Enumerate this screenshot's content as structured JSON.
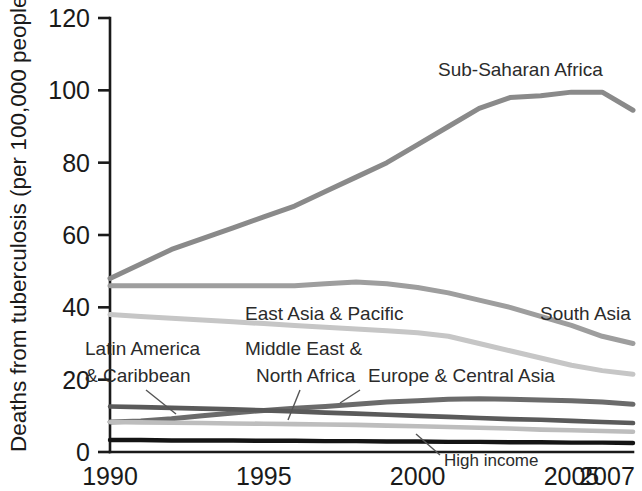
{
  "chart_data": {
    "type": "line",
    "title": "",
    "xlabel": "",
    "ylabel": "Deaths from tuberculosis (per 100,000 people)",
    "xlim": [
      1990,
      2007
    ],
    "ylim": [
      0,
      120
    ],
    "yticks": [
      0,
      20,
      40,
      60,
      80,
      100,
      120
    ],
    "ytick_labels": [
      "0",
      "20",
      "40",
      "60",
      "80",
      "100",
      "120"
    ],
    "xticks": [
      1990,
      1995,
      2000,
      2005,
      2007
    ],
    "xtick_labels": [
      "1990",
      "1995",
      "2000",
      "2005",
      "2007"
    ],
    "grid": false,
    "legend_position": "inline-labels",
    "x": [
      1990,
      1991,
      1992,
      1993,
      1994,
      1995,
      1996,
      1997,
      1998,
      1999,
      2000,
      2001,
      2002,
      2003,
      2004,
      2005,
      2006,
      2007
    ],
    "series": [
      {
        "name": "Sub-Saharan Africa",
        "color": "#8a8a8a",
        "width": 5.0,
        "values": [
          48,
          52,
          56,
          59,
          62,
          65,
          68,
          72,
          76,
          80,
          85,
          90,
          95,
          98,
          98.5,
          99.5,
          99.5,
          94.5
        ]
      },
      {
        "name": "South Asia",
        "color": "#9e9e9e",
        "width": 5.0,
        "values": [
          46,
          46,
          46,
          46,
          46,
          46,
          46,
          46.5,
          47,
          46.5,
          45.5,
          44,
          42,
          40,
          37.5,
          35,
          32,
          30
        ]
      },
      {
        "name": "East Asia & Pacific",
        "color": "#c6c6c6",
        "width": 5.0,
        "values": [
          38,
          37.5,
          37,
          36.5,
          36,
          35.5,
          35,
          34.5,
          34,
          33.5,
          33,
          32,
          30,
          28,
          26,
          24,
          22.5,
          21.5
        ]
      },
      {
        "name": "Europe & Central Asia",
        "color": "#6b6b6b",
        "width": 5.0,
        "values": [
          8.3,
          8.6,
          9.2,
          10.0,
          10.8,
          11.5,
          12.1,
          12.6,
          13.2,
          13.8,
          14.2,
          14.6,
          14.7,
          14.6,
          14.4,
          14.2,
          13.8,
          13.2
        ]
      },
      {
        "name": "Latin America & Caribbean",
        "color": "#5a5a5a",
        "width": 4.6,
        "values": [
          12.6,
          12.4,
          12.2,
          12.0,
          11.8,
          11.5,
          11.2,
          10.9,
          10.6,
          10.3,
          10.0,
          9.7,
          9.4,
          9.1,
          8.9,
          8.6,
          8.3,
          8.0
        ]
      },
      {
        "name": "Middle East & North Africa",
        "color": "#bdbdbd",
        "width": 4.6,
        "values": [
          8.3,
          8.2,
          8.1,
          8.0,
          7.9,
          7.8,
          7.7,
          7.6,
          7.5,
          7.3,
          7.1,
          6.9,
          6.7,
          6.5,
          6.2,
          6.0,
          5.8,
          5.6
        ]
      },
      {
        "name": "High income",
        "color": "#141414",
        "width": 4.4,
        "values": [
          3.3,
          3.3,
          3.2,
          3.2,
          3.2,
          3.1,
          3.1,
          3.0,
          3.0,
          2.9,
          2.9,
          2.8,
          2.8,
          2.7,
          2.7,
          2.6,
          2.6,
          2.5
        ]
      }
    ],
    "annotations": [
      {
        "text": "Sub-Saharan Africa",
        "x": 438,
        "y": 76
      },
      {
        "text": "South Asia",
        "x": 540,
        "y": 320
      },
      {
        "text": "East Asia & Pacific",
        "x": 245,
        "y": 320
      },
      {
        "text": "Latin America",
        "x": 85,
        "y": 355
      },
      {
        "text": "& Caribbean",
        "x": 85,
        "y": 382
      },
      {
        "text": "Middle East &",
        "x": 245,
        "y": 355
      },
      {
        "text": "North Africa",
        "x": 256,
        "y": 382
      },
      {
        "text": "Europe & Central Asia",
        "x": 368,
        "y": 382
      },
      {
        "text": "High income",
        "x": 444,
        "y": 466
      }
    ]
  }
}
